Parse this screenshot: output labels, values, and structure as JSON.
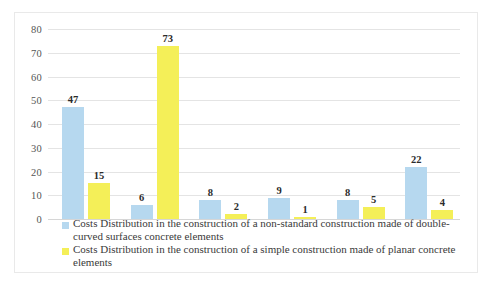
{
  "chart_data": {
    "type": "bar",
    "title": "",
    "subtitle": "",
    "xlabel": "",
    "ylabel": "",
    "ylim": [
      0,
      80
    ],
    "yticks": [
      0,
      10,
      20,
      30,
      40,
      50,
      60,
      70,
      80
    ],
    "grid": true,
    "legend_position": "bottom-left",
    "categories": [
      "1",
      "2",
      "3",
      "4",
      "5",
      "6"
    ],
    "show_category_labels": false,
    "series": [
      {
        "name": "Costs Distribution in the construction of a non-standard construction made of double-curved surfaces concrete elements",
        "color": "#b6d8ef",
        "values": [
          47,
          6,
          8,
          9,
          8,
          22
        ]
      },
      {
        "name": "Costs Distribution in the construction of a simple construction made of planar concrete elements",
        "color": "#f4ef58",
        "values": [
          15,
          73,
          2,
          1,
          5,
          4
        ]
      }
    ]
  },
  "axis": {
    "y_tick_labels": [
      "80",
      "70",
      "60",
      "50",
      "40",
      "30",
      "20",
      "10",
      "0"
    ]
  },
  "legend": {
    "items": [
      {
        "swatch_color": "#b6d8ef",
        "label": "Costs Distribution in the construction of a non-standard construction made of double-curved surfaces concrete elements"
      },
      {
        "swatch_color": "#f4ef58",
        "label": "Costs Distribution in the construction of a simple construction made of planar concrete elements"
      }
    ]
  },
  "data_labels": {
    "series_0": [
      "47",
      "6",
      "8",
      "9",
      "8",
      "22"
    ],
    "series_1": [
      "15",
      "73",
      "2",
      "1",
      "5",
      "4"
    ]
  }
}
